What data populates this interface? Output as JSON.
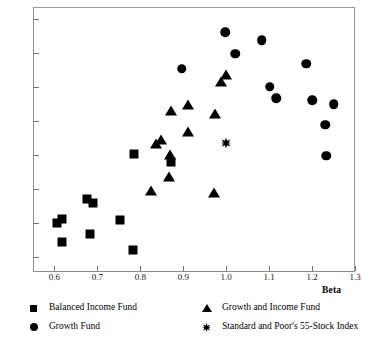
{
  "chart_data": {
    "type": "scatter",
    "title": "",
    "xlabel": "Beta",
    "ylabel": "",
    "xlim": [
      0.55,
      1.3
    ],
    "ylim": [
      5.55,
      13.35
    ],
    "grid": false,
    "legend_position": "bottom",
    "xticks": [
      "0.6",
      "0.7",
      "0.8",
      "0.9",
      "1.0",
      "1.1",
      "1.2",
      "1.3"
    ],
    "xtick_values": [
      0.6,
      0.7,
      0.8,
      0.9,
      1.0,
      1.1,
      1.2,
      1.3
    ],
    "yticks": [
      "6",
      "7",
      "8",
      "9",
      "10",
      "11",
      "12",
      "13"
    ],
    "ytick_values": [
      6,
      7,
      8,
      9,
      10,
      11,
      12,
      13
    ],
    "series": [
      {
        "name": "Balanced Income Fund",
        "marker": "square",
        "color": "#000000",
        "points": [
          [
            0.605,
            6.99
          ],
          [
            0.618,
            7.12
          ],
          [
            0.617,
            6.44
          ],
          [
            0.676,
            7.7
          ],
          [
            0.69,
            7.58
          ],
          [
            0.683,
            6.67
          ],
          [
            0.753,
            7.08
          ],
          [
            0.782,
            6.21
          ],
          [
            0.785,
            9.02
          ],
          [
            0.872,
            8.8
          ]
        ]
      },
      {
        "name": "Growth Fund",
        "marker": "circle",
        "color": "#000000",
        "points": [
          [
            0.897,
            11.53
          ],
          [
            0.998,
            12.6
          ],
          [
            1.021,
            11.97
          ],
          [
            1.083,
            12.37
          ],
          [
            1.101,
            11.01
          ],
          [
            1.117,
            10.66
          ],
          [
            1.186,
            11.68
          ],
          [
            1.201,
            10.6
          ],
          [
            1.231,
            9.88
          ],
          [
            1.25,
            10.49
          ],
          [
            1.233,
            8.97
          ]
        ]
      },
      {
        "name": "Growth and Income Fund",
        "marker": "triangle",
        "color": "#000000",
        "points": [
          [
            0.826,
            7.92
          ],
          [
            0.836,
            9.31
          ],
          [
            0.848,
            9.43
          ],
          [
            0.867,
            8.36
          ],
          [
            0.869,
            8.98
          ],
          [
            0.872,
            10.28
          ],
          [
            0.911,
            10.46
          ],
          [
            0.912,
            9.68
          ],
          [
            0.971,
            7.88
          ],
          [
            0.973,
            10.2
          ],
          [
            0.987,
            11.14
          ],
          [
            1.0,
            11.36
          ]
        ]
      },
      {
        "name": "Standard and Poor's 55-Stock Index",
        "marker": "star",
        "color": "#000000",
        "points": [
          [
            1.0,
            9.35
          ]
        ]
      }
    ]
  },
  "legend": {
    "items": [
      {
        "label": "Balanced Income Fund",
        "marker": "square"
      },
      {
        "label": "Growth Fund",
        "marker": "circle"
      },
      {
        "label": "Growth and Income Fund",
        "marker": "triangle"
      },
      {
        "label": "Standard and Poor's 55-Stock Index",
        "marker": "star"
      }
    ]
  }
}
